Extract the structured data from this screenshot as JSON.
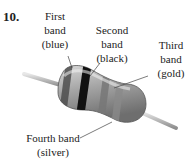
{
  "problem_number": "10.",
  "labels": {
    "first": {
      "line1": "First",
      "line2": "band",
      "line3": "(blue)"
    },
    "second": {
      "line1": "Second",
      "line2": "band",
      "line3": "(black)"
    },
    "third": {
      "line1": "Third",
      "line2": "band",
      "line3": "(gold)"
    },
    "fourth": {
      "line1": "Fourth band",
      "line2": "(silver)"
    }
  },
  "colors": {
    "body": "#a8a8a8",
    "first_band": "#555555",
    "second_band": "#111111",
    "third_band": "#888888",
    "fourth_band": "#9a9a9a",
    "lead": "#bdbdbd"
  }
}
